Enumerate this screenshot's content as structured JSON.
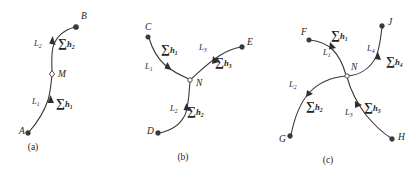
{
  "figure": {
    "title": "",
    "background_color": "#ffffff",
    "stroke_color": "#3a3a3a",
    "text_color": "#232323",
    "panels": [
      {
        "id": "a",
        "caption": "(a)",
        "caption_pos": [
          33,
          150
        ],
        "description": "single open traverse between two known points A and B with one intermediate node M",
        "points": [
          {
            "name": "A",
            "label": "A",
            "type": "filled",
            "x": 28,
            "y": 133,
            "label_x": 19,
            "label_y": 134
          },
          {
            "name": "B",
            "label": "B",
            "type": "filled",
            "x": 76,
            "y": 27,
            "label_x": 81,
            "label_y": 19
          },
          {
            "name": "M",
            "label": "M",
            "type": "open-diamond",
            "x": 52,
            "y": 74,
            "label_x": 58,
            "label_y": 77
          }
        ],
        "segments": [
          {
            "name": "L1",
            "letter": "L",
            "sub": "1",
            "label_x": 32,
            "label_y": 104
          },
          {
            "name": "L2",
            "letter": "L",
            "sub": "2",
            "label_x": 34,
            "label_y": 46
          }
        ],
        "sums": [
          {
            "name": "sum-h1",
            "symbol": "∑",
            "letter": "h",
            "sub": "1",
            "x": 56,
            "y": 107
          },
          {
            "name": "sum-h2",
            "symbol": "∑",
            "letter": "h",
            "sub": "2",
            "x": 58,
            "y": 47
          }
        ]
      },
      {
        "id": "b",
        "caption": "(b)",
        "caption_pos": [
          183,
          160
        ],
        "description": "three-branch junction network with node N joining known points C, D and E",
        "points": [
          {
            "name": "C",
            "label": "C",
            "type": "filled",
            "x": 148,
            "y": 37,
            "label_x": 145,
            "label_y": 30
          },
          {
            "name": "D",
            "label": "D",
            "type": "filled",
            "x": 158,
            "y": 133,
            "label_x": 147,
            "label_y": 134
          },
          {
            "name": "E",
            "label": "E",
            "type": "filled",
            "x": 242,
            "y": 47,
            "label_x": 247,
            "label_y": 45
          },
          {
            "name": "N",
            "label": "N",
            "type": "open-circle",
            "x": 190,
            "y": 80,
            "label_x": 196,
            "label_y": 86
          }
        ],
        "segments": [
          {
            "name": "L1",
            "letter": "L",
            "sub": "1",
            "label_x": 145,
            "label_y": 69
          },
          {
            "name": "L2",
            "letter": "L",
            "sub": "2",
            "label_x": 170,
            "label_y": 111
          },
          {
            "name": "L3",
            "letter": "L",
            "sub": "3",
            "label_x": 199,
            "label_y": 50
          }
        ],
        "sums": [
          {
            "name": "sum-h1",
            "symbol": "∑",
            "letter": "h",
            "sub": "1",
            "x": 161,
            "y": 53
          },
          {
            "name": "sum-h2",
            "symbol": "∑",
            "letter": "h",
            "sub": "2",
            "x": 187,
            "y": 115
          },
          {
            "name": "sum-h3",
            "symbol": "∑",
            "letter": "h",
            "sub": "3",
            "x": 215,
            "y": 66
          }
        ]
      },
      {
        "id": "c",
        "caption": "(c)",
        "caption_pos": [
          328,
          163
        ],
        "description": "four-branch junction network with node N joining known points F, G, H and J",
        "points": [
          {
            "name": "F",
            "label": "F",
            "type": "filled",
            "x": 309,
            "y": 40,
            "label_x": 301,
            "label_y": 35
          },
          {
            "name": "G",
            "label": "G",
            "type": "filled",
            "x": 290,
            "y": 136,
            "label_x": 279,
            "label_y": 142
          },
          {
            "name": "H",
            "label": "H",
            "type": "filled",
            "x": 392,
            "y": 139,
            "label_x": 398,
            "label_y": 140
          },
          {
            "name": "J",
            "label": "J",
            "type": "filled",
            "x": 382,
            "y": 26,
            "label_x": 388,
            "label_y": 25
          },
          {
            "name": "N",
            "label": "N",
            "type": "open-circle",
            "x": 347,
            "y": 76,
            "label_x": 351,
            "label_y": 70
          }
        ],
        "segments": [
          {
            "name": "L1",
            "letter": "L",
            "sub": "1",
            "label_x": 323,
            "label_y": 55
          },
          {
            "name": "L2",
            "letter": "L",
            "sub": "2",
            "label_x": 289,
            "label_y": 87
          },
          {
            "name": "L3",
            "letter": "L",
            "sub": "3",
            "label_x": 345,
            "label_y": 115
          },
          {
            "name": "L4",
            "letter": "L",
            "sub": "4",
            "label_x": 367,
            "label_y": 51
          }
        ],
        "sums": [
          {
            "name": "sum-h1",
            "symbol": "∑",
            "letter": "h",
            "sub": "1",
            "x": 331,
            "y": 39
          },
          {
            "name": "sum-h2",
            "symbol": "∑",
            "letter": "h",
            "sub": "2",
            "x": 306,
            "y": 110
          },
          {
            "name": "sum-h3",
            "symbol": "∑",
            "letter": "h",
            "sub": "3",
            "x": 364,
            "y": 111
          },
          {
            "name": "sum-h4",
            "symbol": "∑",
            "letter": "h",
            "sub": "4",
            "x": 386,
            "y": 65
          }
        ]
      }
    ]
  }
}
